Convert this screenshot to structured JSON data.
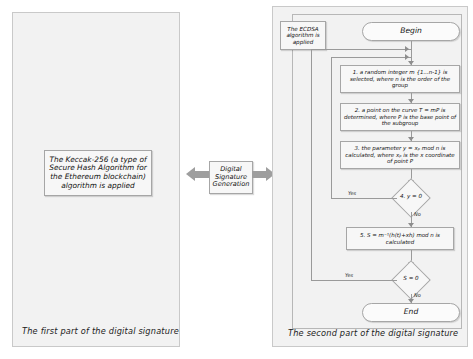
{
  "figure": {
    "left_panel": {
      "caption": "The first part of the digital signature",
      "note": "The Keccak-256  (a type of Secure Hash Algorithm for the Ethereum blockchain) algorithm is applied"
    },
    "middle": {
      "label": "Digital Signature Generation",
      "left_arrow": "arrow-left",
      "right_arrow": "arrow-right"
    },
    "right_panel": {
      "caption": "The second part of the digital signature",
      "note": "The ECDSA algorithm is applied",
      "flowchart": {
        "start": "Begin",
        "end": "End",
        "steps": [
          "1. a random integer m  {1...n-1} is selected, where n is the order of the group",
          "2. a point on the curve T = mP is determined, where P is the base point of the subgroup",
          "3. the parameter y = xₚ mod n is calculated, where xₚ is the x coordinate of point P",
          "5. S = m⁻¹(h(t)+xh) mod n is calculated"
        ],
        "decisions": [
          {
            "label": "4. y = 0",
            "yes": "Yes",
            "no": "No"
          },
          {
            "label": "S = 0",
            "yes": "Yes",
            "no": "No"
          }
        ]
      }
    }
  }
}
